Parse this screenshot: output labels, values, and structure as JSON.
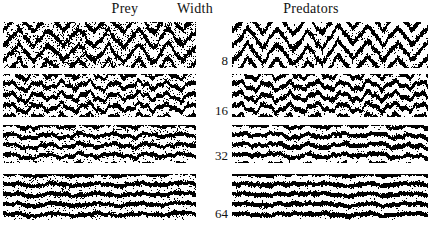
{
  "figure": {
    "title_headers": {
      "left_column": "Prey",
      "middle_column": "Width",
      "right_column": "Predators"
    },
    "width_labels": [
      "8",
      "16",
      "32",
      "64"
    ],
    "colors": {
      "background": "#ffffff",
      "ink": "#111111",
      "texture_dark": "#000000",
      "texture_light": "#ffffff"
    }
  },
  "chart_data": {
    "type": "heatmap",
    "title": "",
    "subtitle": "",
    "xlabel": "",
    "ylabel": "Width",
    "grid": false,
    "legend_position": "none",
    "column_headers": [
      "Prey",
      "Width",
      "Predators"
    ],
    "row_labels": [
      "8",
      "16",
      "32",
      "64"
    ],
    "panels": [
      {
        "row": 0,
        "width": 8,
        "column": "Prey",
        "pattern": "chevron",
        "bands": 3,
        "band_period_px": 15,
        "wave_amplitude_px": 9,
        "wave_wavelength_px": 30,
        "density": 0.46,
        "line_thickness_px": 3.4,
        "noise_scale": 1.0
      },
      {
        "row": 0,
        "width": 8,
        "column": "Predators",
        "pattern": "chevron",
        "bands": 3,
        "band_period_px": 15,
        "wave_amplitude_px": 9,
        "wave_wavelength_px": 30,
        "density": 0.56,
        "line_thickness_px": 4.2,
        "noise_scale": 1.0
      },
      {
        "row": 1,
        "width": 16,
        "column": "Prey",
        "pattern": "wavy-bands",
        "bands": 4,
        "band_period_px": 11,
        "wave_amplitude_px": 3.2,
        "wave_wavelength_px": 26,
        "density": 0.5,
        "line_thickness_px": 3.0,
        "noise_scale": 0.9
      },
      {
        "row": 1,
        "width": 16,
        "column": "Predators",
        "pattern": "wavy-bands",
        "bands": 4,
        "band_period_px": 11,
        "wave_amplitude_px": 3.2,
        "wave_wavelength_px": 26,
        "density": 0.58,
        "line_thickness_px": 3.6,
        "noise_scale": 0.9
      },
      {
        "row": 2,
        "width": 32,
        "column": "Prey",
        "pattern": "bands",
        "bands": 4,
        "band_period_px": 10,
        "wave_amplitude_px": 1.6,
        "wave_wavelength_px": 34,
        "density": 0.52,
        "line_thickness_px": 2.8,
        "noise_scale": 0.75
      },
      {
        "row": 2,
        "width": 32,
        "column": "Predators",
        "pattern": "bands",
        "bands": 4,
        "band_period_px": 10,
        "wave_amplitude_px": 1.6,
        "wave_wavelength_px": 34,
        "density": 0.6,
        "line_thickness_px": 3.4,
        "noise_scale": 0.75
      },
      {
        "row": 3,
        "width": 64,
        "column": "Prey",
        "pattern": "bands",
        "bands": 4,
        "band_period_px": 10,
        "wave_amplitude_px": 1.0,
        "wave_wavelength_px": 42,
        "density": 0.54,
        "line_thickness_px": 3.0,
        "noise_scale": 0.6
      },
      {
        "row": 3,
        "width": 64,
        "column": "Predators",
        "pattern": "bands",
        "bands": 4,
        "band_period_px": 10,
        "wave_amplitude_px": 1.0,
        "wave_wavelength_px": 42,
        "density": 0.62,
        "line_thickness_px": 3.6,
        "noise_scale": 0.6
      }
    ],
    "layout": {
      "prey_panel_x": 3,
      "prey_panel_w": 193,
      "pred_panel_x": 232,
      "pred_panel_w": 196,
      "row_tops": [
        22,
        74,
        125,
        174
      ],
      "row_heights": [
        46,
        43,
        38,
        46
      ],
      "label_x": 196,
      "label_w": 32,
      "label_baselines": [
        66,
        116,
        161,
        219
      ]
    }
  }
}
